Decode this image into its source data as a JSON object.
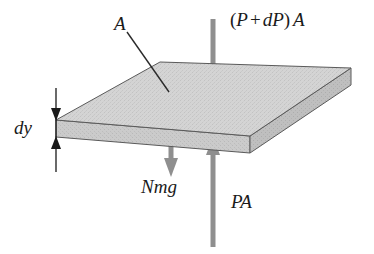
{
  "figure": {
    "background_color": "#ffffff"
  },
  "slab": {
    "name": "air-slab",
    "fill_color": "#d2d2d2",
    "edge_color": "#555555",
    "front_face_fill": "#c9c9c9",
    "right_face_fill": "#bcbcbc"
  },
  "labels": {
    "area": "A",
    "thickness": "dy",
    "weight": "Nmg",
    "pressure_bottom": "PA",
    "pressure_top_open": "(",
    "pressure_top_p": "P",
    "pressure_top_plus": "+",
    "pressure_top_dp": "dP",
    "pressure_top_close": ")",
    "pressure_top_a": "A",
    "pressure_top_full": "(P + dP) A"
  },
  "arrows": {
    "top_force": {
      "name": "pressure-top-arrow",
      "direction": "down",
      "color": "#8f8f8f",
      "label": "(P + dP) A"
    },
    "weight": {
      "name": "weight-arrow",
      "direction": "down",
      "color": "#8f8f8f",
      "label": "Nmg"
    },
    "bottom_force": {
      "name": "pressure-bottom-arrow",
      "direction": "up",
      "color": "#8f8f8f",
      "label": "PA"
    },
    "dimension": {
      "name": "dy-dimension-arrow",
      "direction": "both",
      "color": "#1a1a1a",
      "label": "dy"
    }
  },
  "leader_line": {
    "name": "area-leader-line",
    "color": "#2a2a2a"
  }
}
